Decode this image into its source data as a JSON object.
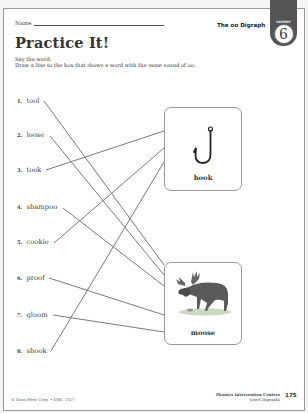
{
  "header": {
    "name_label": "Name",
    "topic": "The oo Digraph",
    "badge_label": "center",
    "badge_number": "6"
  },
  "title": "Practice It!",
  "instructions": [
    "Say the word.",
    "Draw a line to the box that shows a word with the same sound of oo."
  ],
  "words": [
    {
      "num": "1.",
      "word": "tool",
      "matched_to": "moose"
    },
    {
      "num": "2.",
      "word": "loose",
      "matched_to": "moose"
    },
    {
      "num": "3.",
      "word": "took",
      "matched_to": "hook"
    },
    {
      "num": "4.",
      "word": "shampoo",
      "matched_to": "moose"
    },
    {
      "num": "5.",
      "word": "cookie",
      "matched_to": "hook"
    },
    {
      "num": "6.",
      "word": "proof",
      "matched_to": "moose"
    },
    {
      "num": "7.",
      "word": "gloom",
      "matched_to": "moose"
    },
    {
      "num": "8.",
      "word": "shook",
      "matched_to": "hook"
    }
  ],
  "cards": [
    {
      "label": "hook",
      "icon": "fish-hook-icon"
    },
    {
      "label": "moose",
      "icon": "moose-illustration"
    }
  ],
  "footer": {
    "copyright": "© Evan-Moor Corp. • EMC 3327",
    "series": "Phonics Intervention Centers",
    "subtitle": "Vowel Digraphs",
    "page_number": "175"
  },
  "colors": {
    "line": "#7a7a7a",
    "badge": "#555555"
  }
}
